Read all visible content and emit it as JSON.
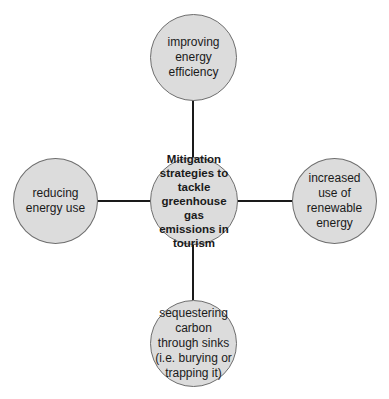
{
  "diagram": {
    "type": "hub-and-spoke",
    "center": {
      "label": "Mitigation strategies to tackle greenhouse gas emissions in tourism"
    },
    "nodes": [
      {
        "id": "top",
        "label": "improving energy efficiency"
      },
      {
        "id": "right",
        "label": "increased use of renewable energy"
      },
      {
        "id": "bottom",
        "label": "sequestering carbon through sinks (i.e. burying or trapping it)"
      },
      {
        "id": "left",
        "label": "reducing energy use"
      }
    ],
    "colors": {
      "node_fill": "#dcdcdc",
      "node_border": "#6e6e6e",
      "connector": "#1a1a1a"
    }
  }
}
